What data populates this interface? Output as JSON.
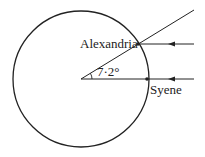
{
  "diagram": {
    "labels": {
      "alexandria": "Alexandria",
      "syene": "Syene",
      "angle": "7·2°"
    },
    "colors": {
      "stroke": "#222222",
      "background": "#ffffff"
    },
    "geometry": {
      "circle": {
        "cx": 81,
        "cy": 79,
        "r": 68
      },
      "center": {
        "x": 81,
        "y": 79
      },
      "alexandria_point": {
        "x": 138,
        "y": 44
      },
      "syene_point": {
        "x": 147,
        "y": 79
      },
      "angle_degrees": 7.2
    },
    "elements": [
      {
        "type": "circle",
        "name": "earth"
      },
      {
        "type": "ray",
        "name": "radius-to-syene",
        "description": "horizontal line from center through Syene"
      },
      {
        "type": "ray",
        "name": "radius-to-alexandria",
        "description": "line from center through Alexandria extended beyond"
      },
      {
        "type": "arrow",
        "name": "sunray-alexandria",
        "direction": "left"
      },
      {
        "type": "arrow",
        "name": "sunray-syene",
        "direction": "left"
      },
      {
        "type": "arc",
        "name": "angle-arc"
      }
    ]
  }
}
